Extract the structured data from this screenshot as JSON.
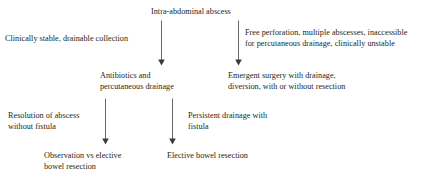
{
  "figure": {
    "type": "flowchart",
    "background_color": "#ffffff",
    "text_color": "#231f20",
    "line_color": "#58585a"
  },
  "nodes": {
    "root": "Intra-abdominal abscess",
    "branch_left": "Clinically stable, drainable collection",
    "branch_right": "Free perforation, multiple abscesses, inaccessible\nfor percutaneous drainage, clinically unstable",
    "mid_left": "Antibiotics and\npercutaneous drainage",
    "mid_right": "Emergent surgery with drainage,\ndiversion, with or without resection",
    "outcome_left": "Resolution of abscess\nwithout fistula",
    "outcome_right": "Persistent drainage with\nfistula",
    "final_left": "Observation vs elective\nbowel resection",
    "final_right": "Elective bowel resection"
  },
  "edges": [
    {
      "name": "root-to-antibiotics",
      "from": "root",
      "to": "mid_left",
      "label": "branch_left",
      "direction": "down"
    },
    {
      "name": "root-to-emergent-surgery",
      "from": "root",
      "to": "mid_right",
      "label": "branch_right",
      "direction": "down"
    },
    {
      "name": "antibiotics-to-observation",
      "from": "mid_left",
      "to": "final_left",
      "label": "outcome_left",
      "direction": "down"
    },
    {
      "name": "antibiotics-to-elective-resection",
      "from": "mid_left",
      "to": "final_right",
      "label": "outcome_right",
      "direction": "down"
    }
  ]
}
